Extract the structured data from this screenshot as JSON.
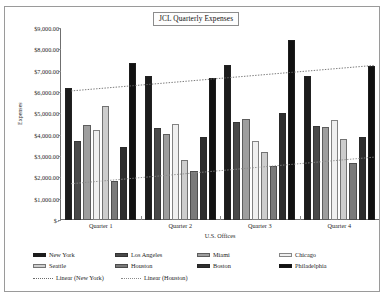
{
  "chart_data": {
    "type": "bar",
    "title": "JCL Quarterly Expenses",
    "xlabel": "U.S. Offices",
    "ylabel": "Expenses",
    "categories": [
      "Quarter 1",
      "Quarter 2",
      "Quarter 3",
      "Quarter 4"
    ],
    "ylim": [
      0,
      9000
    ],
    "ytick_values": [
      0,
      1000,
      2000,
      3000,
      4000,
      5000,
      6000,
      7000,
      8000,
      9000
    ],
    "ytick_labels": [
      "$-",
      "$1,000.00",
      "$2,000.00",
      "$3,000.00",
      "$4,000.00",
      "$5,000.00",
      "$6,000.00",
      "$7,000.00",
      "$8,000.00",
      "$9,000.00"
    ],
    "grid": false,
    "legend_position": "bottom",
    "series": [
      {
        "name": "New York",
        "color": "#1c1c1c",
        "values": [
          6200,
          6750,
          7250,
          6750
        ]
      },
      {
        "name": "Los Angeles",
        "color": "#4a4a4a",
        "values": [
          3700,
          4300,
          4600,
          4400
        ]
      },
      {
        "name": "Miami",
        "color": "#9e9e9e",
        "values": [
          4450,
          4050,
          4750,
          4350
        ]
      },
      {
        "name": "Chicago",
        "color": "#efefef",
        "values": [
          4200,
          4500,
          3700,
          4700
        ]
      },
      {
        "name": "Seattle",
        "color": "#cdcdcd",
        "values": [
          5350,
          2800,
          3200,
          3800
        ]
      },
      {
        "name": "Houston",
        "color": "#7a7a7a",
        "values": [
          1850,
          2300,
          2550,
          2650
        ]
      },
      {
        "name": "Boston",
        "color": "#2e2e2e",
        "values": [
          3400,
          3900,
          5000,
          3900
        ]
      },
      {
        "name": "Philadelphia",
        "color": "#111111",
        "values": [
          7350,
          6650,
          8450,
          7200
        ]
      }
    ],
    "trendlines": [
      {
        "name": "Linear (New York)",
        "style": "dotted",
        "color": "#6b6b6b",
        "y_start": 6050,
        "y_end": 7250
      },
      {
        "name": "Linear (Houston)",
        "style": "dotted",
        "color": "#8a8a8a",
        "y_start": 1700,
        "y_end": 2950
      }
    ],
    "legend_entries": [
      "New York",
      "Los Angeles",
      "Miami",
      "Chicago",
      "Seattle",
      "Houston",
      "Boston",
      "Philadelphia",
      "Linear (New York)",
      "Linear (Houston)"
    ]
  }
}
